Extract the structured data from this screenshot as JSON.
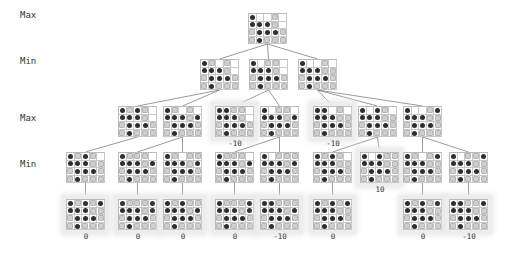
{
  "levels": [
    {
      "label": "Max",
      "y": 10
    },
    {
      "label": "Min",
      "y": 56
    },
    {
      "label": "Max",
      "y": 113
    },
    {
      "label": "Min",
      "y": 159
    }
  ],
  "colors": {
    "x_marker": "#2e2e2e",
    "o_marker": "#cfcfcf",
    "grid": "#c8c8c8",
    "edge": "#555555",
    "highlight": "#ededed"
  },
  "legend": {
    "x": "dark-circle",
    "o": "light-gray-square",
    ".": "empty"
  },
  "nodes": [
    {
      "id": "r",
      "x": 248,
      "y": 13,
      "parent": null,
      "hl": false,
      "score": null,
      "board": [
        "X..O.",
        "XXXO.",
        "OXXXO",
        "OXOOO"
      ]
    },
    {
      "id": "a",
      "x": 200,
      "y": 59,
      "parent": "r",
      "hl": false,
      "score": null,
      "board": [
        "XO.O.",
        "XXXO.",
        "OXXXO",
        "OXOOO"
      ]
    },
    {
      "id": "b",
      "x": 249,
      "y": 59,
      "parent": "r",
      "hl": false,
      "score": null,
      "board": [
        "X.OO.",
        "XXXO.",
        "OXXXO",
        "OXOOO"
      ]
    },
    {
      "id": "c",
      "x": 298,
      "y": 59,
      "parent": "r",
      "hl": false,
      "score": null,
      "board": [
        "X..O.",
        "XXXOO",
        "OXXXO",
        "OXOOO"
      ]
    },
    {
      "id": "aa",
      "x": 118,
      "y": 106,
      "parent": "a",
      "hl": false,
      "score": null,
      "board": [
        "XOXO.",
        "XXXO.",
        "OXXXO",
        "OXOOO"
      ]
    },
    {
      "id": "ab",
      "x": 163,
      "y": 106,
      "parent": "a",
      "hl": false,
      "score": null,
      "board": [
        "XO.O.",
        "XXXOX",
        "OXXXO",
        "OXOOO"
      ]
    },
    {
      "id": "ba",
      "x": 215,
      "y": 106,
      "parent": "b",
      "hl": true,
      "score": "-10",
      "board": [
        "XXOO.",
        "XXXO.",
        "OXXXO",
        "OXOOO"
      ]
    },
    {
      "id": "bb",
      "x": 260,
      "y": 106,
      "parent": "b",
      "hl": false,
      "score": null,
      "board": [
        "X.OO.",
        "XXXOX",
        "OXXXO",
        "OXOOO"
      ]
    },
    {
      "id": "ca",
      "x": 313,
      "y": 106,
      "parent": "c",
      "hl": true,
      "score": "-10",
      "board": [
        "XX.O.",
        "XXXOO",
        "OXXXO",
        "OXOOO"
      ]
    },
    {
      "id": "cb",
      "x": 358,
      "y": 106,
      "parent": "c",
      "hl": false,
      "score": null,
      "board": [
        "X.XO.",
        "XXXOO",
        "OXXXO",
        "OXOOO"
      ]
    },
    {
      "id": "cc",
      "x": 403,
      "y": 106,
      "parent": "c",
      "hl": false,
      "score": null,
      "board": [
        "X..OX",
        "XXXOO",
        "OXXXO",
        "OXOOO"
      ]
    },
    {
      "id": "aaa",
      "x": 66,
      "y": 152,
      "parent": "aa",
      "hl": false,
      "score": null,
      "board": [
        "XOXO.",
        "XXXOO",
        "OXXXO",
        "OXOOO"
      ]
    },
    {
      "id": "aba",
      "x": 118,
      "y": 152,
      "parent": "ab",
      "hl": false,
      "score": null,
      "board": [
        "XOOO.",
        "XXXOX",
        "OXXXO",
        "OXOOO"
      ]
    },
    {
      "id": "abb",
      "x": 163,
      "y": 152,
      "parent": "ab",
      "hl": false,
      "score": null,
      "board": [
        "XO.OO",
        "XXXOX",
        "OXXXO",
        "OXOOO"
      ]
    },
    {
      "id": "bba",
      "x": 215,
      "y": 152,
      "parent": "bb",
      "hl": false,
      "score": null,
      "board": [
        "XOOO.",
        "XXXOX",
        "OXXXO",
        "OXOOO"
      ]
    },
    {
      "id": "bbb",
      "x": 260,
      "y": 152,
      "parent": "bb",
      "hl": false,
      "score": null,
      "board": [
        "X.OOO",
        "XXXOX",
        "OXXXO",
        "OXOOO"
      ]
    },
    {
      "id": "cba",
      "x": 313,
      "y": 152,
      "parent": "cb",
      "hl": false,
      "score": null,
      "board": [
        "XOXO.",
        "XXXOO",
        "OXXXO",
        "OXOOO"
      ]
    },
    {
      "id": "cbb",
      "x": 360,
      "y": 152,
      "parent": "cb",
      "hl": true,
      "score": "10",
      "board": [
        "X.XOO",
        "XXXOO",
        "OXXXO",
        "OXOOO"
      ]
    },
    {
      "id": "cca",
      "x": 403,
      "y": 152,
      "parent": "cc",
      "hl": false,
      "score": null,
      "board": [
        "XO.OX",
        "XXXOO",
        "OXXXO",
        "OXOOO"
      ]
    },
    {
      "id": "ccb",
      "x": 449,
      "y": 152,
      "parent": "cc",
      "hl": false,
      "score": null,
      "board": [
        "X.OOX",
        "XXXOO",
        "OXXXO",
        "OXOOO"
      ]
    },
    {
      "id": "aaaa",
      "x": 66,
      "y": 199,
      "parent": "aaa",
      "hl": true,
      "score": "0",
      "board": [
        "XOXOX",
        "XXXOO",
        "OXXXO",
        "OXOOO"
      ]
    },
    {
      "id": "abaa",
      "x": 118,
      "y": 199,
      "parent": "aba",
      "hl": true,
      "score": "0",
      "board": [
        "XOOOX",
        "XXXOX",
        "OXXXO",
        "OXOOO"
      ]
    },
    {
      "id": "abba",
      "x": 163,
      "y": 199,
      "parent": "abb",
      "hl": true,
      "score": "0",
      "board": [
        "XOXOO",
        "XXXOX",
        "OXXXO",
        "OXOOO"
      ]
    },
    {
      "id": "bbaa",
      "x": 215,
      "y": 199,
      "parent": "bba",
      "hl": true,
      "score": "0",
      "board": [
        "XOOOX",
        "XXXOX",
        "OXXXO",
        "OXOOO"
      ]
    },
    {
      "id": "bbba",
      "x": 260,
      "y": 199,
      "parent": "bbb",
      "hl": true,
      "score": "-10",
      "board": [
        "XXOOO",
        "XXXOX",
        "OXXXO",
        "OXOOO"
      ]
    },
    {
      "id": "cbaa",
      "x": 313,
      "y": 199,
      "parent": "cba",
      "hl": true,
      "score": "0",
      "board": [
        "XOXOX",
        "XXXOO",
        "OXXXO",
        "OXOOO"
      ]
    },
    {
      "id": "ccaa",
      "x": 403,
      "y": 199,
      "parent": "cca",
      "hl": true,
      "score": "0",
      "board": [
        "XOXOX",
        "XXXOO",
        "OXXXO",
        "OXOOO"
      ]
    },
    {
      "id": "ccba",
      "x": 449,
      "y": 199,
      "parent": "ccb",
      "hl": true,
      "score": "-10",
      "board": [
        "XXOOX",
        "XXXOO",
        "OXXXO",
        "OXOOO"
      ]
    }
  ]
}
